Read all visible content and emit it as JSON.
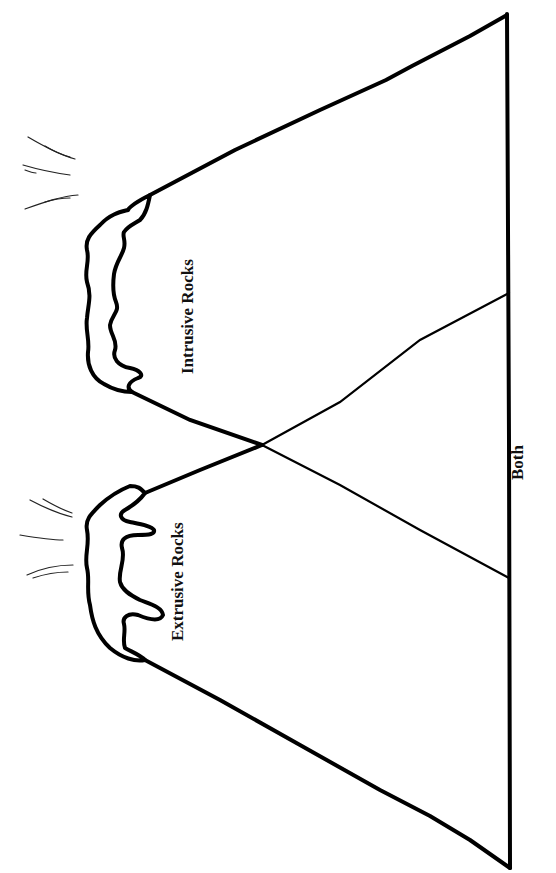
{
  "diagram": {
    "type": "venn-style volcano comparison diagram (rotated 90° counter-clockwise)",
    "stroke_color": "#000000",
    "background_color": "#ffffff",
    "regions": [
      {
        "id": "extrusive",
        "label": "Extrusive Rocks"
      },
      {
        "id": "intrusive",
        "label": "Intrusive Rocks"
      },
      {
        "id": "both",
        "label": "Both"
      }
    ],
    "volcanoes": [
      {
        "id": "extrusive-volcano",
        "crater": "lava overflowing with drips",
        "steam_lines": 6
      },
      {
        "id": "intrusive-volcano",
        "crater": "wavy lava rim",
        "steam_lines": 6
      }
    ]
  }
}
